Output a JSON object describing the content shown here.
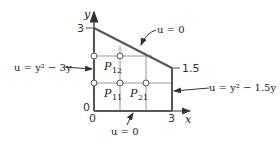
{
  "axes": {
    "x_label": "x",
    "y_label": "y",
    "origin_x": "0",
    "origin_y": "0",
    "x_tick": "3",
    "y_tick_top": "3",
    "y_tick_right": "1.5"
  },
  "boundary_conditions": {
    "top": "u = 0",
    "bottom": "u = 0",
    "left": "u = y² − 3y",
    "right": "u = y² − 1.5y"
  },
  "grid_points": [
    {
      "label": "P",
      "sub": "12"
    },
    {
      "label": "P",
      "sub": "11"
    },
    {
      "label": "P",
      "sub": "21"
    }
  ],
  "colors": {
    "boundary": "#555555",
    "grid": "#9a9a9a",
    "text": "#222222"
  }
}
